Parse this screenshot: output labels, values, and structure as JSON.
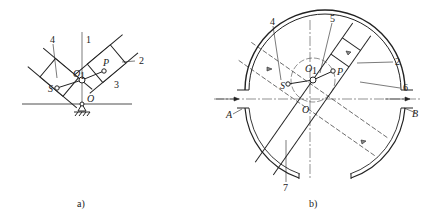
{
  "figure_a": {
    "caption": "a)",
    "labels": {
      "n1": "1",
      "n2": "2",
      "n3": "3",
      "n4": "4",
      "O": "O",
      "O1": "O",
      "O1_sub": "1",
      "P": "P",
      "S": "S"
    }
  },
  "figure_b": {
    "caption": "b)",
    "labels": {
      "n2": "2",
      "n4": "4",
      "n5": "5",
      "n6": "6",
      "n7": "7",
      "A": "A",
      "B": "B",
      "O": "O",
      "O1": "O",
      "O1_sub": "1",
      "P": "P",
      "S": "S"
    }
  },
  "colors": {
    "line": "#222222",
    "background": "#ffffff"
  }
}
